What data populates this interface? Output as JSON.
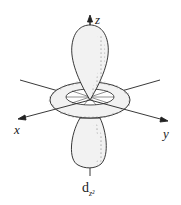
{
  "diagram": {
    "axes": {
      "z": "z",
      "x": "x",
      "y": "y"
    },
    "caption": {
      "main": "d",
      "subscript": "z²"
    },
    "components": [
      "upper lobe along +z",
      "lower lobe along -z",
      "torus (donut) in xy-plane"
    ],
    "colors": {
      "fill": "#f2f2f2",
      "stroke": "#222222",
      "stipple": "#555555"
    }
  }
}
